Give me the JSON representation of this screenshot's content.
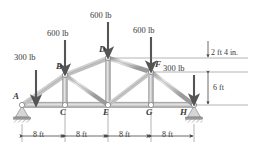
{
  "figure": {
    "background_color": "#ffffff",
    "member_color": "#b9b9b9",
    "member_edge_color": "#8f8f8f",
    "joint_fill": "#ffffff",
    "joint_stroke": "#7d7d7d",
    "arrow_color": "#555555",
    "dim_color": "#444444",
    "text_color": "#3a3a3a"
  },
  "loads": [
    {
      "id": "load-B",
      "label": "600 lb",
      "at_joint": "B",
      "direction": "down"
    },
    {
      "id": "load-D",
      "label": "600 lb",
      "at_joint": "D",
      "direction": "down"
    },
    {
      "id": "load-F",
      "label": "600 lb",
      "at_joint": "F",
      "direction": "down"
    },
    {
      "id": "load-A",
      "label": "300 lb",
      "at_joint": "A",
      "direction": "down"
    },
    {
      "id": "load-H",
      "label": "300 lb",
      "at_joint": "H",
      "direction": "down"
    }
  ],
  "joints": [
    {
      "label": "A",
      "x": 0,
      "y": 0,
      "chord": "bottom",
      "support": "pin-hatched"
    },
    {
      "label": "B",
      "x": 8,
      "y": 3.167,
      "chord": "top"
    },
    {
      "label": "C",
      "x": 8,
      "y": 0,
      "chord": "bottom"
    },
    {
      "label": "D",
      "x": 16,
      "y": 6.0,
      "chord": "top"
    },
    {
      "label": "E",
      "x": 16,
      "y": 0,
      "chord": "bottom"
    },
    {
      "label": "F",
      "x": 24,
      "y": 3.667,
      "chord": "top"
    },
    {
      "label": "G",
      "x": 24,
      "y": 0,
      "chord": "bottom"
    },
    {
      "label": "H",
      "x": 32,
      "y": 0,
      "chord": "bottom",
      "support": "pin-triangle"
    }
  ],
  "dimensions": {
    "bottom_spans": [
      {
        "label": "8 ft"
      },
      {
        "label": "8 ft"
      },
      {
        "label": "8 ft"
      },
      {
        "label": "8 ft"
      }
    ],
    "right_upper": {
      "label": "2 ft 4 in."
    },
    "right_lower": {
      "label": "6 ft"
    }
  },
  "icons": {
    "down_arrow": "down-arrow-icon",
    "dimension_arrow": "dimension-arrow-icon",
    "pin_support": "pin-support-icon",
    "roller_support": "roller-support-icon",
    "joint": "joint-pin-icon"
  }
}
